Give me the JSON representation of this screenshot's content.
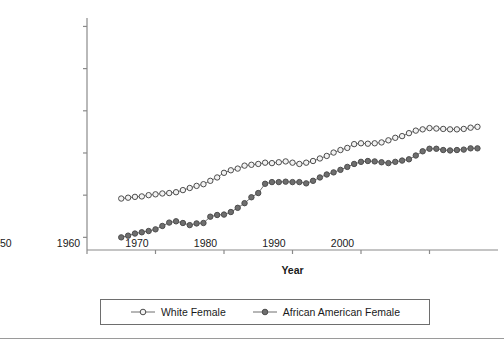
{
  "chart_data": {
    "type": "line",
    "title": "",
    "xlabel": "Year",
    "ylabel": "Median Income (2007 Dollars)",
    "xlim": [
      1950,
      2010
    ],
    "ylim": [
      7000,
      62000
    ],
    "xticks": [
      1950,
      1960,
      1970,
      1980,
      1990,
      2000
    ],
    "xtick_labels": [
      "1950",
      "1960",
      "1970",
      "1980",
      "1990",
      "2000"
    ],
    "yticks": [
      10000,
      20000,
      30000,
      40000,
      50000,
      60000
    ],
    "ytick_labels": [
      "10,000",
      "20,000",
      "30,000",
      "40,000",
      "50,000",
      "60,000"
    ],
    "grid": false,
    "legend_position": "bottom",
    "x": [
      1955,
      1956,
      1957,
      1958,
      1959,
      1960,
      1961,
      1962,
      1963,
      1964,
      1965,
      1966,
      1967,
      1968,
      1969,
      1970,
      1971,
      1972,
      1973,
      1974,
      1975,
      1976,
      1977,
      1978,
      1979,
      1980,
      1981,
      1982,
      1983,
      1984,
      1985,
      1986,
      1987,
      1988,
      1989,
      1990,
      1991,
      1992,
      1993,
      1994,
      1995,
      1996,
      1997,
      1998,
      1999,
      2000,
      2001,
      2002,
      2003,
      2004,
      2005,
      2006,
      2007
    ],
    "series": [
      {
        "name": "White Female",
        "marker": "open-circle",
        "color": "#595959",
        "fill": "#f0f0f0",
        "values": [
          19200,
          19400,
          19600,
          19700,
          20000,
          20200,
          20400,
          20500,
          20700,
          21200,
          21700,
          22200,
          22600,
          23400,
          24200,
          25300,
          25900,
          26300,
          27000,
          27200,
          27400,
          27700,
          27600,
          27800,
          28000,
          27700,
          27400,
          27700,
          28100,
          28700,
          29300,
          30100,
          30700,
          31200,
          32100,
          32300,
          32200,
          32300,
          32500,
          33000,
          33600,
          34000,
          34700,
          35300,
          35600,
          35900,
          35800,
          35700,
          35600,
          35600,
          35700,
          36000,
          36200
        ]
      },
      {
        "name": "African American Female",
        "marker": "filled-circle",
        "color": "#595959",
        "fill": "#6b6b6b",
        "values": [
          10000,
          10400,
          10900,
          11200,
          11500,
          11900,
          12700,
          13500,
          13800,
          13400,
          12900,
          13300,
          13400,
          14900,
          15300,
          15400,
          16000,
          17000,
          18100,
          19500,
          20500,
          22700,
          23100,
          23100,
          23200,
          23100,
          23100,
          22800,
          23400,
          24200,
          24900,
          25400,
          26000,
          26700,
          27400,
          27900,
          28100,
          28000,
          27800,
          27600,
          27900,
          28200,
          28500,
          29400,
          30400,
          31000,
          31000,
          30700,
          30600,
          30700,
          30800,
          31100,
          31100
        ]
      }
    ],
    "legend": [
      {
        "label": "White Female",
        "marker": "open-circle"
      },
      {
        "label": "African American Female",
        "marker": "filled-circle"
      }
    ]
  },
  "style": {
    "axis_color": "#8a8a8a",
    "line_color": "#6e6e6e",
    "open_marker_fill": "#f2f2f2",
    "filled_marker_fill": "#6e6e6e",
    "marker_edge": "#4d4d4d",
    "text_color": "#1a1a1a"
  }
}
